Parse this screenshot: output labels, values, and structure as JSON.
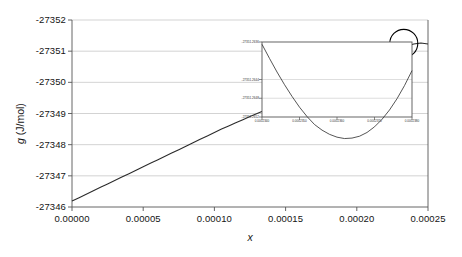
{
  "chart_data": {
    "type": "line",
    "title": "",
    "xlabel": "x",
    "ylabel": "g (J/mol)",
    "xlim": [
      0.0,
      0.00025
    ],
    "ylim": [
      -27352,
      -27346
    ],
    "grid": true,
    "legend": null,
    "x_ticks": [
      "0.00000",
      "0.00005",
      "0.00010",
      "0.00015",
      "0.00020",
      "0.00025"
    ],
    "x_tick_values": [
      0.0,
      5e-05,
      0.0001,
      0.00015,
      0.0002,
      0.00025
    ],
    "y_ticks": [
      "-27346",
      "-27347",
      "-27348",
      "-27349",
      "-27350",
      "-27351",
      "-27352"
    ],
    "y_tick_values": [
      -27346,
      -27347,
      -27348,
      -27349,
      -27350,
      -27351,
      -27352
    ],
    "series": [
      {
        "name": "g(x)",
        "x": [
          0.0,
          5e-06,
          1e-05,
          1.5e-05,
          2e-05,
          2.5e-05,
          3e-05,
          3.5e-05,
          4e-05,
          4.5e-05,
          5e-05,
          5.5e-05,
          6e-05,
          6.5e-05,
          7e-05,
          7.5e-05,
          8e-05,
          8.5e-05,
          9e-05,
          9.5e-05,
          0.0001,
          0.000105,
          0.00011,
          0.000115,
          0.00012,
          0.000125,
          0.00013,
          0.000135,
          0.00014,
          0.000145,
          0.00015,
          0.000155,
          0.00016,
          0.000165,
          0.00017,
          0.000175,
          0.00018,
          0.000185,
          0.00019,
          0.000195,
          0.0002,
          0.000205,
          0.00021,
          0.000215,
          0.00022,
          0.000225,
          0.00023,
          0.000235,
          0.00024,
          0.000245,
          0.00025
        ],
        "y": [
          -27346.19,
          -27346.3,
          -27346.41,
          -27346.52,
          -27346.63,
          -27346.74,
          -27346.85,
          -27346.96,
          -27347.07,
          -27347.18,
          -27347.29,
          -27347.4,
          -27347.51,
          -27347.62,
          -27347.73,
          -27347.84,
          -27347.95,
          -27348.06,
          -27348.17,
          -27348.28,
          -27348.39,
          -27348.5,
          -27348.6,
          -27348.7,
          -27348.8,
          -27348.9,
          -27349.0,
          -27349.1,
          -27349.2,
          -27349.3,
          -27349.4,
          -27349.5,
          -27349.6,
          -27349.7,
          -27349.8,
          -27349.9,
          -27350.0,
          -27350.1,
          -27350.2,
          -27350.3,
          -27350.4,
          -27350.5,
          -27350.6,
          -27350.7,
          -27350.8,
          -27350.92,
          -27351.05,
          -27351.16,
          -27351.23,
          -27351.26,
          -27351.23
        ]
      }
    ],
    "annotations": [
      {
        "type": "circle",
        "name": "minimum-highlight-circle",
        "center_x": 0.000233,
        "center_y": -27351.25,
        "radius_px": 14
      },
      {
        "type": "arrow",
        "name": "zoom-callout-arrow",
        "from_x": 0.000227,
        "from_y": -27351.1,
        "to_x": 0.000184,
        "to_y": -27349.55
      }
    ],
    "inset": {
      "type": "line",
      "name": "minimum-detail-inset",
      "xlim": [
        0.000234,
        0.000238
      ],
      "ylim": [
        -27351.2652,
        -27351.2636
      ],
      "grid": true,
      "x_ticks": [
        "0.0002340",
        "0.0002350",
        "0.0002360",
        "0.0002370",
        "0.0002380"
      ],
      "y_ticks": [
        "-27351.2636",
        "-27351.2644",
        "-27351.2648",
        "-27351.2652"
      ],
      "y_tick_values": [
        -27351.2636,
        -27351.2644,
        -27351.2648,
        -27351.2652
      ],
      "series": [
        {
          "name": "g(x) detail",
          "x": [
            0.000234,
            0.0002342,
            0.0002344,
            0.0002346,
            0.0002348,
            0.000235,
            0.0002352,
            0.0002354,
            0.0002356,
            0.0002358,
            0.000236,
            0.0002362,
            0.0002364,
            0.0002366,
            0.0002368,
            0.000237,
            0.0002372,
            0.0002374,
            0.0002376,
            0.0002378,
            0.000238
          ],
          "y": [
            -27351.26365,
            -27351.26395,
            -27351.26424,
            -27351.26451,
            -27351.26476,
            -27351.26499,
            -27351.26519,
            -27351.26536,
            -27351.26548,
            -27351.26557,
            -27351.26563,
            -27351.26566,
            -27351.26565,
            -27351.26561,
            -27351.26553,
            -27351.26541,
            -27351.26525,
            -27351.26505,
            -27351.26481,
            -27351.26453,
            -27351.26421
          ]
        }
      ]
    }
  },
  "style": {
    "curve_color": "#2b2b2b",
    "grid_color": "#c8c8c8",
    "axis_color": "#555555",
    "annotation_color": "#000000",
    "background": "#ffffff"
  }
}
